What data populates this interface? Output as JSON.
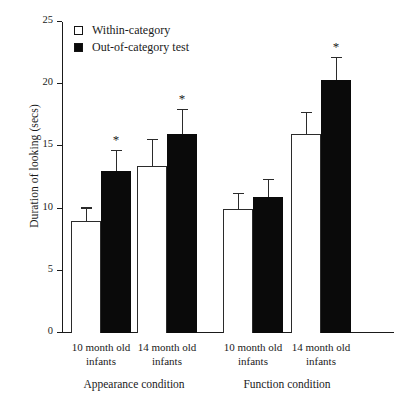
{
  "chart_data": {
    "type": "bar",
    "title": "",
    "xlabel": "",
    "ylabel": "Duration of looking (secs)",
    "ylim": [
      0,
      25
    ],
    "yticks": [
      0,
      5,
      10,
      15,
      20,
      25
    ],
    "grid": false,
    "legend_position": "top-left",
    "categories": [
      "10 month old infants",
      "14 month old infants",
      "10 month old infants",
      "14 month old infants"
    ],
    "group_labels": [
      "Appearance condition",
      "Function condition"
    ],
    "series": [
      {
        "name": "Within-category",
        "color": "#ffffff",
        "edge_color": "#2b2b2b",
        "values": [
          9.0,
          13.4,
          10.0,
          16.0
        ],
        "errors": [
          1.0,
          2.1,
          1.2,
          1.7
        ],
        "significant": [
          false,
          false,
          false,
          false
        ]
      },
      {
        "name": "Out-of-category test",
        "color": "#0a0a0a",
        "edge_color": "#0a0a0a",
        "values": [
          13.0,
          16.0,
          10.9,
          20.3
        ],
        "errors": [
          1.6,
          1.9,
          1.4,
          1.8
        ],
        "significant": [
          true,
          true,
          false,
          true
        ]
      }
    ],
    "annotations": [
      {
        "label": "*",
        "series": "Out-of-category test",
        "category_index": 0
      },
      {
        "label": "*",
        "series": "Out-of-category test",
        "category_index": 1
      },
      {
        "label": "*",
        "series": "Out-of-category test",
        "category_index": 3
      }
    ],
    "significance_marker": "*"
  },
  "axis": {
    "y_title": "Duration of looking (secs)",
    "tick_labels": [
      "0",
      "5",
      "10",
      "15",
      "20",
      "25"
    ]
  },
  "legend": {
    "items": [
      {
        "label": "Within-category",
        "swatch": "open-square"
      },
      {
        "label": "Out-of-category test",
        "swatch": "filled-square"
      }
    ]
  },
  "xaxis": {
    "groups": [
      {
        "line1": "10 month old",
        "line2": "infants"
      },
      {
        "line1": "14 month old",
        "line2": "infants"
      },
      {
        "line1": "10 month old",
        "line2": "infants"
      },
      {
        "line1": "14 month old",
        "line2": "infants"
      }
    ],
    "conditions": [
      {
        "label": "Appearance condition"
      },
      {
        "label": "Function condition"
      }
    ]
  }
}
